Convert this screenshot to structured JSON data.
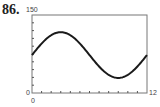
{
  "problem_number": "86.",
  "chart_data": {
    "type": "line",
    "title": "",
    "xlabel": "",
    "ylabel": "",
    "xlim": [
      0,
      12
    ],
    "ylim": [
      0,
      150
    ],
    "x_tick_labels": [
      "0",
      "12"
    ],
    "y_tick_labels": [
      "0",
      "150"
    ],
    "x_minor_ticks": 12,
    "y_minor_ticks": 10,
    "grid": false,
    "series": [
      {
        "name": "curve",
        "x": [
          0,
          1,
          2,
          3,
          4,
          5,
          6,
          7,
          8,
          9,
          10,
          11,
          12
        ],
        "y": [
          73,
          95,
          111,
          117,
          111,
          95,
          73,
          51,
          35,
          29,
          35,
          51,
          73
        ]
      }
    ]
  },
  "labels": {
    "y_max": "150",
    "y_min": "0",
    "x_min": "0",
    "x_max": "12"
  }
}
